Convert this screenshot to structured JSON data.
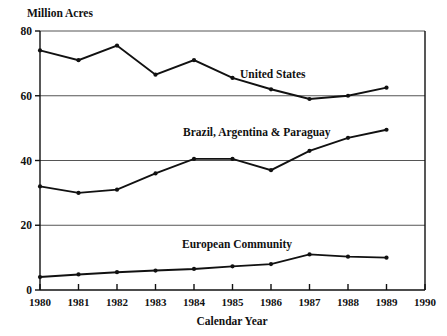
{
  "chart_data": {
    "type": "line",
    "title": "",
    "xlabel": "Calendar Year",
    "ylabel": "Million Acres",
    "xlim": [
      1980,
      1990
    ],
    "ylim": [
      0,
      80
    ],
    "grid": true,
    "legend_position": "inline-annotations",
    "x": [
      1980,
      1981,
      1982,
      1983,
      1984,
      1985,
      1986,
      1987,
      1988,
      1989
    ],
    "xticks": [
      "1980",
      "1981",
      "1982",
      "1983",
      "1984",
      "1985",
      "1986",
      "1987",
      "1988",
      "1989",
      "1990"
    ],
    "yticks": [
      "0",
      "20",
      "40",
      "60",
      "80"
    ],
    "series": [
      {
        "name": "United States",
        "values": [
          74,
          71,
          75.5,
          66.5,
          71,
          65.5,
          62,
          59,
          60,
          62.5
        ],
        "label_text": "United States"
      },
      {
        "name": "Brazil, Argentina & Paraguay",
        "values": [
          32,
          30,
          31,
          36,
          40.5,
          40.5,
          37,
          43,
          47,
          49.5
        ],
        "label_text": "Brazil, Argentina & Paraguay"
      },
      {
        "name": "European Community",
        "values": [
          4,
          4.8,
          5.5,
          6,
          6.5,
          7.3,
          8,
          11,
          10.3,
          10
        ],
        "label_text": "European Community"
      }
    ],
    "colors": {
      "line": "#111111",
      "grid": "#555555",
      "axis": "#111111",
      "background": "#ffffff"
    }
  }
}
